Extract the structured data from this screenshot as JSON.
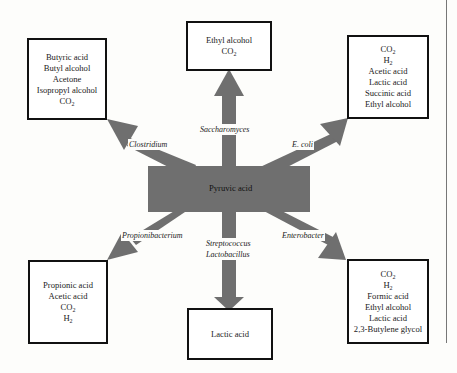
{
  "diagram": {
    "center": {
      "label": "Pyruvic acid",
      "color": "#6f6f6f"
    },
    "arrow_color": "#6f6f6f",
    "branches": {
      "top": {
        "organism": "Saccharomyces",
        "products": [
          "Ethyl alcohol",
          "CO2"
        ]
      },
      "top_left": {
        "organism": "Clostridium",
        "products": [
          "Butyric acid",
          "Butyl alcohol",
          "Acetone",
          "Isopropyl alcohol",
          "CO2"
        ]
      },
      "top_right": {
        "organism": "E. coli",
        "products": [
          "CO2",
          "H2",
          "Acetic acid",
          "Lactic acid",
          "Succinic acid",
          "Ethyl alcohol"
        ]
      },
      "bottom_left": {
        "organism": "Propionibacterium",
        "products": [
          "Propionic acid",
          "Acetic acid",
          "CO2",
          "H2"
        ]
      },
      "bottom": {
        "organism_line1": "Streptococcus",
        "organism_line2": "Lactobacillus",
        "products": [
          "Lactic acid"
        ]
      },
      "bottom_right": {
        "organism": "Enterobacter",
        "products": [
          "CO2",
          "H2",
          "Formic acid",
          "Ethyl alcohol",
          "Lactic acid",
          "2,3-Butylene glycol"
        ]
      }
    }
  }
}
